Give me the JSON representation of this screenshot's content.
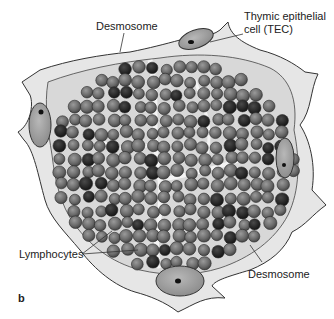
{
  "figure": {
    "panel_letter": "b",
    "labels": {
      "desmosome_top": "Desmosome",
      "tec_line1": "Thymic epithelial",
      "tec_line2": "cell (TEC)",
      "lymphocytes": "Lymphocytes",
      "desmosome_bottom": "Desmosome"
    },
    "colors": {
      "background": "#ffffff",
      "lymphocyte_fill": "#6e6e6e",
      "lymphocyte_dark": "#2a2a2a",
      "tec_nucleus": "#9a9a9a",
      "cytoplasm": "#e4e4e4",
      "outline": "#333333"
    }
  }
}
